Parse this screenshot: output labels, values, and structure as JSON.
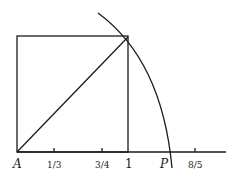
{
  "diagram": {
    "labels": {
      "origin": "A",
      "tick_one_third": "1/3",
      "tick_three_quarters": "3/4",
      "tick_one": "1",
      "point_p": "P",
      "tick_eight_fifths": "8/5"
    },
    "colors": {
      "stroke": "#1a1a1a",
      "background": "#ffffff"
    }
  }
}
